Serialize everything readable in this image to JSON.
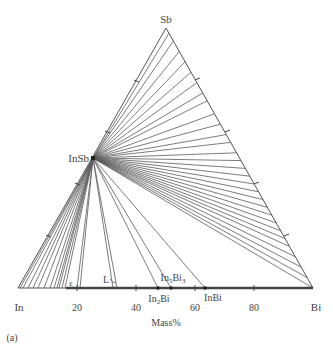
{
  "diagram": {
    "type": "ternary_isothermal_section",
    "system": "In-Sb-Bi",
    "panel_label": "(a)",
    "axis_label": "Mass%",
    "vertices": {
      "top": "Sb",
      "left": "In",
      "right": "Bi"
    },
    "base_ticks": [
      "20",
      "40",
      "60",
      "80"
    ],
    "compound_labels": {
      "insb": "InSb",
      "in2bi": "In2Bi",
      "in5bi3": "In5Bi3",
      "inbi": "InBi",
      "liquid": "L",
      "epsilon": "ε"
    },
    "colors": {
      "line": "#555555",
      "text": "#444444",
      "background": "#ffffff"
    }
  },
  "chart_data": {
    "type": "ternary",
    "title": "",
    "components": [
      "In",
      "Sb",
      "Bi"
    ],
    "axis_label": "Mass%",
    "base_axis_ticks": [
      0,
      20,
      40,
      60,
      80,
      100
    ],
    "phases": [
      "InSb",
      "In2Bi",
      "In5Bi3",
      "InBi",
      "L",
      "ε"
    ],
    "tie_line_fans": [
      {
        "from": "InSb",
        "to_edge": "Sb-Bi",
        "count_approx": 28
      },
      {
        "from": "InSb",
        "to_edge": "In-Bi",
        "count_approx": 20
      }
    ],
    "base_phase_positions_mass_pct_Bi": {
      "ε": 16,
      "L": 32,
      "In2Bi": 47,
      "In5Bi3": 52,
      "InBi": 63
    }
  }
}
